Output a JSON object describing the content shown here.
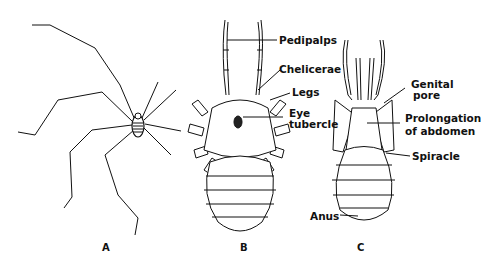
{
  "figure": {
    "panels": [
      {
        "id": "A",
        "caption": "A",
        "subject": "harvestman-whole-body-long-legs"
      },
      {
        "id": "B",
        "caption": "B",
        "subject": "dorsal-view"
      },
      {
        "id": "C",
        "caption": "C",
        "subject": "ventral-view"
      }
    ],
    "labels": {
      "pedipalps": "Pedipalps",
      "chelicerae": "Chelicerae",
      "legs": "Legs",
      "eye": "Eye",
      "tubercle": "tubercle",
      "genital": "Genital",
      "pore": "pore",
      "prolongation": "Prolongation",
      "of_abdomen": "of abdomen",
      "spiracle": "Spiracle",
      "anus": "Anus"
    },
    "colors": {
      "ink": "#111111",
      "paper": "#ffffff"
    }
  }
}
